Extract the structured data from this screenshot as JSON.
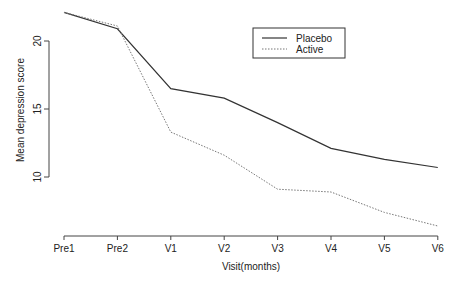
{
  "chart_data": {
    "type": "line",
    "title": "",
    "xlabel": "Visit(months)",
    "ylabel": "Mean depression score",
    "categories": [
      "Pre1",
      "Pre2",
      "V1",
      "V2",
      "V3",
      "V4",
      "V5",
      "V6"
    ],
    "yticks": [
      10,
      15,
      20
    ],
    "ylim": [
      6,
      22.5
    ],
    "grid": false,
    "legend_position": "top-right-inside",
    "series": [
      {
        "name": "Placebo",
        "style": "solid",
        "color": "#333333",
        "values": [
          22.1,
          20.9,
          16.5,
          15.8,
          14.0,
          12.1,
          11.3,
          10.7
        ]
      },
      {
        "name": "Active",
        "style": "dotted",
        "color": "#777777",
        "values": [
          22.1,
          21.1,
          13.3,
          11.6,
          9.1,
          8.9,
          7.4,
          6.4
        ]
      }
    ]
  }
}
